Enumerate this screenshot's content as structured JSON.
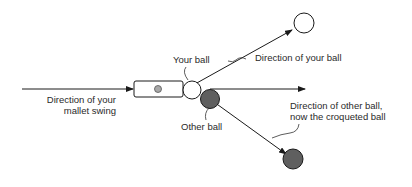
{
  "diagram": {
    "labels": {
      "mallet_swing_line1": "Direction of your",
      "mallet_swing_line2": "mallet swing",
      "your_ball": "Your ball",
      "direction_your_ball": "Direction of your ball",
      "other_ball": "Other ball",
      "direction_other_ball_line1": "Direction of other ball,",
      "direction_other_ball_line2": "now the croqueted ball"
    },
    "colors": {
      "line": "#1a1a1a",
      "your_ball_fill": "#ffffff",
      "other_ball_fill": "#5f5f5f",
      "mallet_dot_fill": "#a8a8a8",
      "text": "#2a2a2a"
    }
  }
}
